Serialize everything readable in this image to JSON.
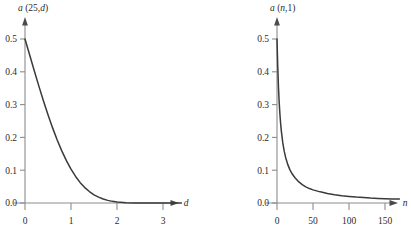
{
  "figure": {
    "title": "",
    "background_color": "#ffffff",
    "curve_color": "#3a3a3a",
    "axis_color": "#8c8c8c",
    "text_color": "#2b2b2b"
  },
  "chart_data": [
    {
      "type": "line",
      "panel": "left",
      "title": "a (25, d)",
      "title_parts": {
        "func": "a",
        "open": " (",
        "arg1": "25",
        "comma": ",",
        "arg2": "d",
        "close": ")"
      },
      "xlabel": "d",
      "ylabel": "",
      "xlim": [
        -0.15,
        3.45
      ],
      "ylim": [
        0.0,
        0.55
      ],
      "xticks": [
        0,
        1,
        2,
        3
      ],
      "xtick_labels": [
        "0",
        "1",
        "2",
        "3"
      ],
      "yticks": [
        0.0,
        0.1,
        0.2,
        0.3,
        0.4,
        0.5
      ],
      "ytick_labels": [
        "0.0",
        "0.1",
        "0.2",
        "0.3",
        "0.4",
        "0.5"
      ],
      "grid": false,
      "legend": "none",
      "x": [
        0.0,
        0.1,
        0.2,
        0.3,
        0.4,
        0.5,
        0.6,
        0.7,
        0.8,
        0.9,
        1.0,
        1.1,
        1.2,
        1.3,
        1.4,
        1.5,
        1.6,
        1.7,
        1.8,
        1.9,
        2.0,
        2.2,
        2.4,
        2.6,
        2.8,
        3.0,
        3.2,
        3.4
      ],
      "y": [
        0.5,
        0.452,
        0.404,
        0.357,
        0.312,
        0.269,
        0.229,
        0.192,
        0.159,
        0.129,
        0.103,
        0.081,
        0.062,
        0.047,
        0.035,
        0.025,
        0.018,
        0.012,
        0.008,
        0.005,
        0.003,
        0.001,
        0.0,
        0.0,
        0.0,
        0.0,
        0.0,
        0.0
      ]
    },
    {
      "type": "line",
      "panel": "right",
      "title": "a (n, 1)",
      "title_parts": {
        "func": "a",
        "open": " (",
        "arg1": "n",
        "comma": ",",
        "arg2": "1",
        "close": ")"
      },
      "xlabel": "n",
      "ylabel": "",
      "xlim": [
        -8,
        178
      ],
      "ylim": [
        0.0,
        0.55
      ],
      "xticks": [
        0,
        50,
        100,
        150
      ],
      "xtick_labels": [
        "0",
        "50",
        "100",
        "150"
      ],
      "yticks": [
        0.0,
        0.1,
        0.2,
        0.3,
        0.4,
        0.5
      ],
      "ytick_labels": [
        "0.0",
        "0.1",
        "0.2",
        "0.3",
        "0.4",
        "0.5"
      ],
      "grid": false,
      "legend": "none",
      "x": [
        0,
        1,
        2,
        3,
        4,
        5,
        6,
        8,
        10,
        12,
        15,
        18,
        21,
        25,
        30,
        35,
        40,
        45,
        50,
        60,
        70,
        80,
        90,
        100,
        110,
        120,
        130,
        140,
        150,
        160,
        170
      ],
      "y": [
        0.5,
        0.418,
        0.355,
        0.308,
        0.272,
        0.243,
        0.22,
        0.184,
        0.158,
        0.139,
        0.117,
        0.101,
        0.089,
        0.077,
        0.065,
        0.056,
        0.049,
        0.044,
        0.04,
        0.034,
        0.029,
        0.025,
        0.022,
        0.02,
        0.018,
        0.017,
        0.015,
        0.014,
        0.013,
        0.012,
        0.012
      ]
    }
  ]
}
